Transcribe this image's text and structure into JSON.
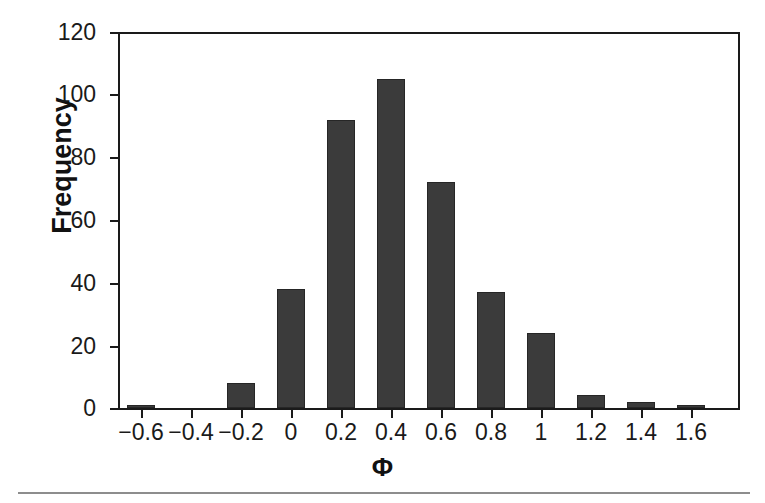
{
  "chart_data": {
    "type": "bar",
    "title": "",
    "subtitle": "",
    "xlabel": "Φ",
    "ylabel": "Frequency",
    "categories": [
      "−0.6",
      "−0.4",
      "−0.2",
      "0",
      "0.2",
      "0.4",
      "0.6",
      "0.8",
      "1",
      "1.2",
      "1.4",
      "1.6"
    ],
    "values": [
      1,
      0,
      8,
      38,
      92,
      105,
      72,
      37,
      24,
      4,
      2,
      1
    ],
    "xlim": [
      -0.7,
      1.7
    ],
    "ylim": [
      0,
      120
    ],
    "ytick_labels": [
      "120",
      "100",
      "80",
      "60",
      "40",
      "20",
      "0"
    ],
    "ytick_values": [
      120,
      100,
      80,
      60,
      40,
      20,
      0
    ],
    "xtick_labels": [
      "−0.6",
      "−0.4",
      "−0.2",
      "0",
      "0.2",
      "0.4",
      "0.6",
      "0.8",
      "1",
      "1.2",
      "1.4",
      "1.6"
    ],
    "grid": false,
    "legend": null,
    "legend_position": "none",
    "bar_color": "#3b3b3b",
    "axis_color": "#1a1a1a",
    "background_color": "#ffffff",
    "annotations": []
  }
}
